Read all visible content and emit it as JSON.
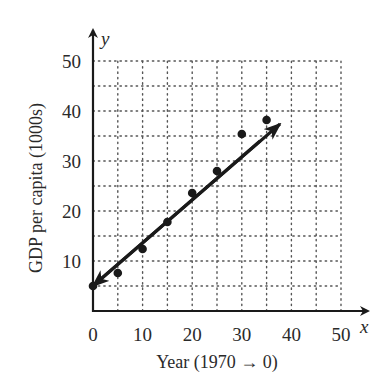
{
  "chart_data": {
    "type": "scatter",
    "title": "",
    "xlabel": "Year (1970 → 0)",
    "ylabel": "GDP per capita (1000s)",
    "x_axis_var": "x",
    "y_axis_var": "y",
    "xlim": [
      0,
      50
    ],
    "ylim": [
      0,
      50
    ],
    "x_ticks": [
      0,
      10,
      20,
      30,
      40,
      50
    ],
    "y_ticks": [
      10,
      20,
      30,
      40,
      50
    ],
    "grid": {
      "on": true,
      "style": "dotted",
      "spacing": 5
    },
    "legend": null,
    "series": [
      {
        "name": "data",
        "type": "scatter",
        "x": [
          0,
          5,
          10,
          15,
          20,
          25,
          30,
          35
        ],
        "y": [
          5,
          7.6,
          12.4,
          17.8,
          23.6,
          28,
          35.4,
          38.2
        ]
      },
      {
        "name": "trend line",
        "type": "line",
        "arrows": "both",
        "x": [
          0,
          37.7
        ],
        "y": [
          5,
          37.4
        ]
      }
    ],
    "colors": {
      "ink": "#1a1a1a",
      "grid": "#555555",
      "text": "#2a2a2a"
    }
  }
}
